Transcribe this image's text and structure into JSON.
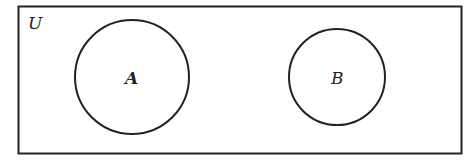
{
  "diagram": {
    "type": "venn",
    "universe": {
      "label": "U"
    },
    "sets": [
      {
        "label": "A",
        "relation": "disjoint"
      },
      {
        "label": "B",
        "relation": "disjoint"
      }
    ]
  },
  "colors": {
    "stroke": "#222222",
    "background": "#ffffff"
  }
}
